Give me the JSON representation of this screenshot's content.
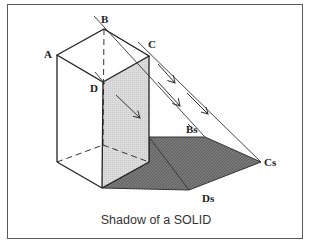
{
  "diagram": {
    "title": "Shadow of a SOLID",
    "vertex_labels": {
      "A": "A",
      "B": "B",
      "C": "C",
      "D": "D",
      "Bs": "Bs",
      "Cs": "Cs",
      "Ds": "Ds"
    },
    "colors": {
      "frame": "#5a5a5a",
      "lines": "#333333",
      "lit_face": "#d8d8d8",
      "shadow": "#6e6e6e",
      "background": "#ffffff"
    }
  }
}
